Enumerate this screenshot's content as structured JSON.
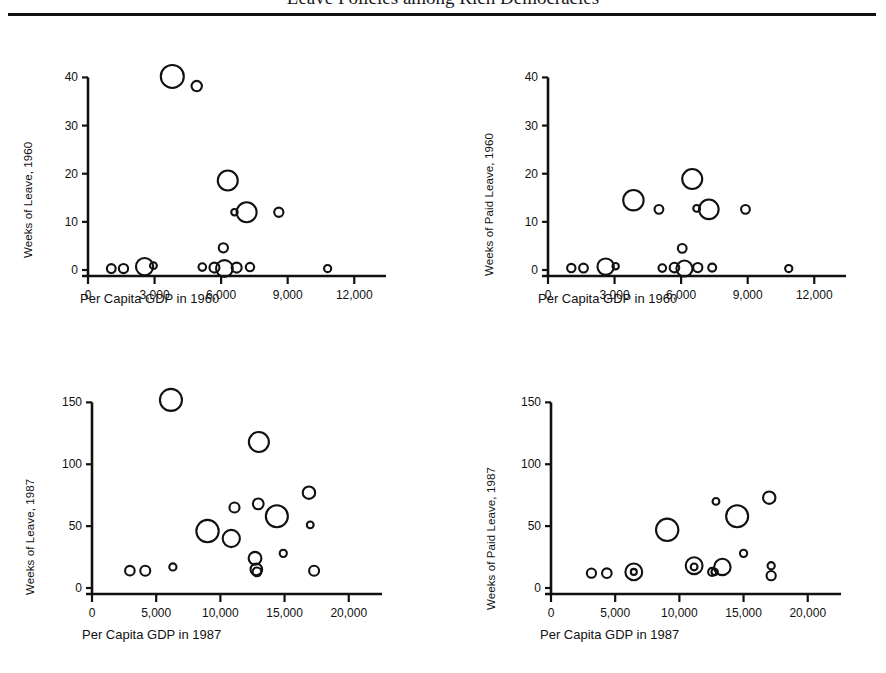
{
  "header": {
    "running_head": "Leave Policies among Rich Democracies",
    "rule": "horizontal-rule"
  },
  "figure": {
    "panels": [
      {
        "id": "top-left",
        "ylabel": "Weeks of Leave, 1960",
        "xlabel": "Per Capita GDP in 1960",
        "xticks": [
          "0",
          "3,000",
          "6,000",
          "9,000",
          "12,000"
        ],
        "yticks": [
          "0",
          "10",
          "20",
          "30",
          "40"
        ]
      },
      {
        "id": "top-right",
        "ylabel": "Weeks of Paid Leave, 1960",
        "xlabel": "Per Capita GDP in 1960",
        "xticks": [
          "0",
          "3,000",
          "6,000",
          "9,000",
          "12,000"
        ],
        "yticks": [
          "0",
          "10",
          "20",
          "30",
          "40"
        ]
      },
      {
        "id": "bottom-left",
        "ylabel": "Weeks of Leave, 1987",
        "xlabel": "Per Capita GDP in 1987",
        "xticks": [
          "0",
          "5,000",
          "10,000",
          "15,000",
          "20,000"
        ],
        "yticks": [
          "0",
          "50",
          "100",
          "150"
        ]
      },
      {
        "id": "bottom-right",
        "ylabel": "Weeks of Paid Leave, 1987",
        "xlabel": "Per Capita GDP in 1987",
        "xticks": [
          "0",
          "5,000",
          "10,000",
          "15,000",
          "20,000"
        ],
        "yticks": [
          "0",
          "50",
          "100",
          "150"
        ]
      }
    ]
  },
  "chart_data": [
    {
      "type": "scatter",
      "panel": "top-left",
      "title": "",
      "xlabel": "Per Capita GDP in 1960",
      "ylabel": "Weeks of Leave, 1960",
      "xlim": [
        0,
        12800
      ],
      "ylim": [
        0,
        43
      ],
      "xticks": [
        0,
        3000,
        6000,
        9000,
        12000
      ],
      "yticks": [
        0,
        10,
        20,
        30,
        40
      ],
      "grid": false,
      "legend": "none",
      "size_encoding": "bubble radius proportional to population",
      "points": [
        {
          "x": 3800,
          "y": 40.2,
          "r": 11.5
        },
        {
          "x": 4900,
          "y": 38.2,
          "r": 5.2
        },
        {
          "x": 6300,
          "y": 18.6,
          "r": 10.0
        },
        {
          "x": 7150,
          "y": 12.0,
          "r": 10.0
        },
        {
          "x": 6600,
          "y": 12.0,
          "r": 3.2
        },
        {
          "x": 8600,
          "y": 12.0,
          "r": 4.6
        },
        {
          "x": 6100,
          "y": 4.6,
          "r": 4.6
        },
        {
          "x": 1050,
          "y": 0.3,
          "r": 4.4
        },
        {
          "x": 1600,
          "y": 0.3,
          "r": 4.6
        },
        {
          "x": 2550,
          "y": 0.7,
          "r": 8.6
        },
        {
          "x": 2950,
          "y": 0.9,
          "r": 3.4
        },
        {
          "x": 5150,
          "y": 0.6,
          "r": 3.8
        },
        {
          "x": 5700,
          "y": 0.5,
          "r": 5.0
        },
        {
          "x": 6150,
          "y": 0.3,
          "r": 8.4
        },
        {
          "x": 6700,
          "y": 0.5,
          "r": 5.0
        },
        {
          "x": 7300,
          "y": 0.6,
          "r": 4.2
        },
        {
          "x": 10800,
          "y": 0.3,
          "r": 3.6
        }
      ]
    },
    {
      "type": "scatter",
      "panel": "top-right",
      "title": "",
      "xlabel": "Per Capita GDP in 1960",
      "ylabel": "Weeks of Paid Leave, 1960",
      "xlim": [
        0,
        12800
      ],
      "ylim": [
        0,
        43
      ],
      "xticks": [
        0,
        3000,
        6000,
        9000,
        12000
      ],
      "yticks": [
        0,
        10,
        20,
        30,
        40
      ],
      "grid": false,
      "legend": "none",
      "size_encoding": "bubble radius proportional to population",
      "points": [
        {
          "x": 3850,
          "y": 14.5,
          "r": 10.2
        },
        {
          "x": 5000,
          "y": 12.6,
          "r": 4.4
        },
        {
          "x": 6500,
          "y": 18.9,
          "r": 10.0
        },
        {
          "x": 7250,
          "y": 12.6,
          "r": 9.8
        },
        {
          "x": 6700,
          "y": 12.8,
          "r": 3.4
        },
        {
          "x": 8900,
          "y": 12.6,
          "r": 4.4
        },
        {
          "x": 6050,
          "y": 4.5,
          "r": 4.4
        },
        {
          "x": 1050,
          "y": 0.4,
          "r": 4.2
        },
        {
          "x": 1600,
          "y": 0.4,
          "r": 4.4
        },
        {
          "x": 2600,
          "y": 0.7,
          "r": 8.2
        },
        {
          "x": 3050,
          "y": 0.8,
          "r": 3.2
        },
        {
          "x": 5150,
          "y": 0.4,
          "r": 3.8
        },
        {
          "x": 5700,
          "y": 0.5,
          "r": 4.8
        },
        {
          "x": 6150,
          "y": 0.3,
          "r": 8.0
        },
        {
          "x": 6750,
          "y": 0.5,
          "r": 4.6
        },
        {
          "x": 7400,
          "y": 0.5,
          "r": 4.0
        },
        {
          "x": 10850,
          "y": 0.3,
          "r": 3.6
        }
      ]
    },
    {
      "type": "scatter",
      "panel": "bottom-left",
      "title": "",
      "xlabel": "Per Capita GDP in 1987",
      "ylabel": "Weeks of Leave, 1987",
      "xlim": [
        0,
        21500
      ],
      "ylim": [
        0,
        160
      ],
      "xticks": [
        0,
        5000,
        10000,
        15000,
        20000
      ],
      "yticks": [
        0,
        50,
        100,
        150
      ],
      "grid": false,
      "legend": "none",
      "size_encoding": "bubble radius proportional to population",
      "points": [
        {
          "x": 6150,
          "y": 152,
          "r": 11.0
        },
        {
          "x": 13000,
          "y": 118,
          "r": 10.0
        },
        {
          "x": 16900,
          "y": 77,
          "r": 6.2
        },
        {
          "x": 12950,
          "y": 68,
          "r": 5.4
        },
        {
          "x": 11100,
          "y": 65,
          "r": 5.0
        },
        {
          "x": 14400,
          "y": 58,
          "r": 11.0
        },
        {
          "x": 17000,
          "y": 51,
          "r": 3.4
        },
        {
          "x": 9000,
          "y": 46,
          "r": 11.2
        },
        {
          "x": 10850,
          "y": 40,
          "r": 8.6
        },
        {
          "x": 14900,
          "y": 28,
          "r": 3.6
        },
        {
          "x": 12700,
          "y": 24,
          "r": 6.4
        },
        {
          "x": 12800,
          "y": 15,
          "r": 5.8
        },
        {
          "x": 12850,
          "y": 13,
          "r": 4.4
        },
        {
          "x": 17300,
          "y": 14,
          "r": 5.0
        },
        {
          "x": 2950,
          "y": 14,
          "r": 4.8
        },
        {
          "x": 4150,
          "y": 14,
          "r": 5.0
        },
        {
          "x": 6300,
          "y": 17,
          "r": 3.6
        }
      ]
    },
    {
      "type": "scatter",
      "panel": "bottom-right",
      "title": "",
      "xlabel": "Per Capita GDP in 1987",
      "ylabel": "Weeks of Paid Leave, 1987",
      "xlim": [
        0,
        21500
      ],
      "ylim": [
        0,
        160
      ],
      "xticks": [
        0,
        5000,
        10000,
        15000,
        20000
      ],
      "yticks": [
        0,
        50,
        100,
        150
      ],
      "grid": false,
      "legend": "none",
      "size_encoding": "bubble radius proportional to population",
      "points": [
        {
          "x": 17000,
          "y": 73,
          "r": 6.2
        },
        {
          "x": 12850,
          "y": 70,
          "r": 3.4
        },
        {
          "x": 14500,
          "y": 58,
          "r": 11.0
        },
        {
          "x": 9050,
          "y": 47,
          "r": 11.2
        },
        {
          "x": 15000,
          "y": 28,
          "r": 3.6
        },
        {
          "x": 11150,
          "y": 18,
          "r": 8.4
        },
        {
          "x": 11150,
          "y": 17,
          "r": 3.4
        },
        {
          "x": 13350,
          "y": 17,
          "r": 8.2
        },
        {
          "x": 12550,
          "y": 13,
          "r": 4.0
        },
        {
          "x": 12750,
          "y": 13,
          "r": 3.2
        },
        {
          "x": 17150,
          "y": 18,
          "r": 3.6
        },
        {
          "x": 17150,
          "y": 10,
          "r": 4.6
        },
        {
          "x": 3150,
          "y": 12,
          "r": 4.6
        },
        {
          "x": 4350,
          "y": 12,
          "r": 4.8
        },
        {
          "x": 6450,
          "y": 13,
          "r": 8.4
        },
        {
          "x": 6450,
          "y": 13,
          "r": 3.0
        }
      ]
    }
  ]
}
